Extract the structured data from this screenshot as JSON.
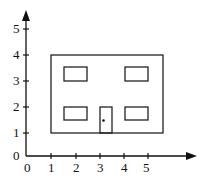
{
  "diagram": {
    "axes": {
      "x_ticks": [
        "0",
        "1",
        "2",
        "3",
        "4",
        "5"
      ],
      "y_ticks": [
        "0",
        "1",
        "2",
        "3",
        "4",
        "5"
      ]
    },
    "shapes": {
      "building": {
        "x1": 1,
        "y1": 1,
        "x2": 5.6,
        "y2": 4
      },
      "windows": [
        {
          "x1": 1.5,
          "y1": 3,
          "x2": 2.5,
          "y2": 3.5
        },
        {
          "x1": 4,
          "y1": 3,
          "x2": 5,
          "y2": 3.5
        },
        {
          "x1": 1.5,
          "y1": 1.5,
          "x2": 2.5,
          "y2": 2
        },
        {
          "x1": 4,
          "y1": 1.5,
          "x2": 5,
          "y2": 2
        }
      ],
      "door": {
        "x1": 3,
        "y1": 1,
        "x2": 3.5,
        "y2": 2
      },
      "door_knob": {
        "x": 3.15,
        "y": 1.5
      }
    }
  }
}
